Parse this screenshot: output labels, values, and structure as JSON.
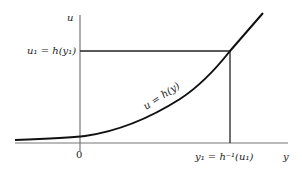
{
  "diagram": {
    "axes": {
      "vertical_label": "u",
      "horizontal_label": "y",
      "origin_label": "0"
    },
    "curve_label": "u = h(y)",
    "u1_label": "u₁ = h(y₁)",
    "y1_label": "y₁ = h⁻¹(u₁)"
  }
}
